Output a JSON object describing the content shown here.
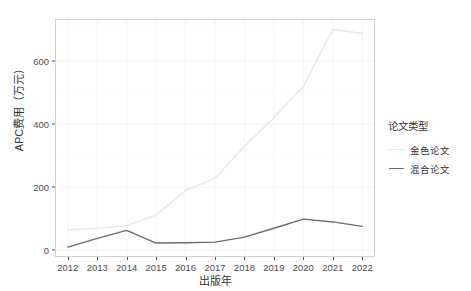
{
  "top_strip": {
    "fragments": [
      "",
      "",
      ""
    ]
  },
  "chart_data": {
    "type": "line",
    "title": "",
    "xlabel": "出版年",
    "ylabel": "APC费用（万元）",
    "x": [
      2012,
      2013,
      2014,
      2015,
      2016,
      2017,
      2018,
      2019,
      2020,
      2021,
      2022
    ],
    "xtick_labels": [
      "2012",
      "2013",
      "2014",
      "2015",
      "2016",
      "2017",
      "2018",
      "2019",
      "2020",
      "2021",
      "2022"
    ],
    "ytick_labels": [
      "0",
      "200",
      "400",
      "600"
    ],
    "yticks": [
      0,
      200,
      400,
      600
    ],
    "ylim": [
      -18,
      730
    ],
    "xlim": [
      2011.6,
      2022.4
    ],
    "grid": true,
    "legend_position": "right",
    "legend_title": "论文类型",
    "series": [
      {
        "name": "金色论文",
        "color": "#e8e8e8",
        "values": [
          65,
          70,
          78,
          112,
          190,
          228,
          330,
          420,
          520,
          700,
          688
        ]
      },
      {
        "name": "混合论文",
        "color": "#6b6b6b",
        "values": [
          10,
          38,
          63,
          23,
          24,
          26,
          42,
          70,
          99,
          90,
          76
        ]
      }
    ]
  }
}
